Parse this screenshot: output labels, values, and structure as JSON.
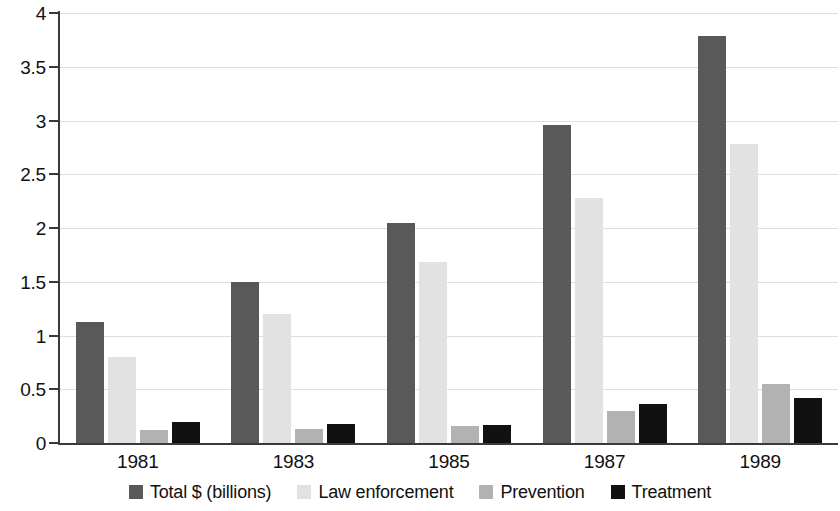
{
  "chart_data": {
    "type": "bar",
    "title": "",
    "subtitle": "",
    "xlabel": "",
    "ylabel": "",
    "categories": [
      "1981",
      "1983",
      "1985",
      "1987",
      "1989"
    ],
    "series": [
      {
        "name": "Total $ (billions)",
        "color": "#595959",
        "values": [
          1.13,
          1.5,
          2.05,
          2.96,
          3.79
        ]
      },
      {
        "name": "Law enforcement",
        "color": "#e2e2e2",
        "values": [
          0.8,
          1.2,
          1.68,
          2.28,
          2.78
        ]
      },
      {
        "name": "Prevention",
        "color": "#b2b2b2",
        "values": [
          0.12,
          0.13,
          0.16,
          0.3,
          0.55
        ]
      },
      {
        "name": "Treatment",
        "color": "#111111",
        "values": [
          0.2,
          0.18,
          0.17,
          0.36,
          0.42
        ]
      }
    ],
    "ylim": [
      0,
      4
    ],
    "yticks": [
      "0",
      "0.5",
      "1",
      "1.5",
      "2",
      "2.5",
      "3",
      "3.5",
      "4"
    ],
    "ytick_values": [
      0,
      0.5,
      1,
      1.5,
      2,
      2.5,
      3,
      3.5,
      4
    ],
    "grid": true,
    "legend_position": "bottom",
    "legend": [
      "Total $ (billions)",
      "Law enforcement",
      "Prevention",
      "Treatment"
    ]
  }
}
